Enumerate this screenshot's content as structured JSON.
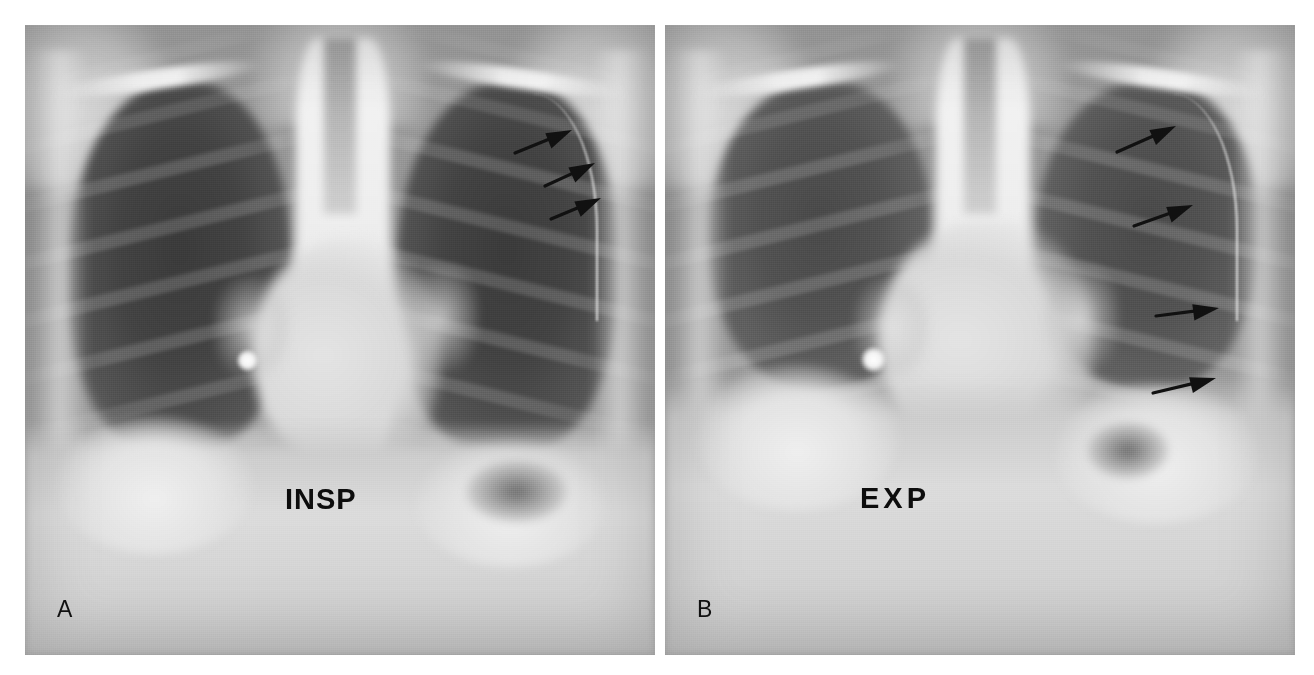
{
  "figure": {
    "kind": "radiograph-pair",
    "modality": "chest-xray",
    "view": "frontal PA",
    "background_color": "#ffffff"
  },
  "panels": [
    {
      "id": "panel-a",
      "letter": "A",
      "phase_label": "INSP",
      "phase_meaning": "inspiration",
      "x": 25,
      "y": 25,
      "width": 630,
      "height": 630,
      "arrow_count": 3,
      "arrows": [
        {
          "tail_x": 515,
          "tail_y": 153,
          "tip_x": 572,
          "tip_y": 130
        },
        {
          "tail_x": 545,
          "tail_y": 186,
          "tip_x": 595,
          "tip_y": 163
        },
        {
          "tail_x": 551,
          "tail_y": 219,
          "tip_x": 601,
          "tip_y": 198
        }
      ]
    },
    {
      "id": "panel-b",
      "letter": "B",
      "phase_label": "EXP",
      "phase_meaning": "expiration",
      "x": 665,
      "y": 25,
      "width": 630,
      "height": 630,
      "arrow_count": 4,
      "arrows": [
        {
          "tail_x": 1117,
          "tail_y": 152,
          "tip_x": 1176,
          "tip_y": 126
        },
        {
          "tail_x": 1134,
          "tail_y": 226,
          "tip_x": 1193,
          "tip_y": 205
        },
        {
          "tail_x": 1156,
          "tail_y": 316,
          "tip_x": 1219,
          "tip_y": 308
        },
        {
          "tail_x": 1153,
          "tail_y": 393,
          "tip_x": 1216,
          "tip_y": 378
        }
      ]
    }
  ],
  "annotation_style": {
    "arrow_color": "#111111",
    "label_color": "#0d0d0d",
    "letter_color": "#111111"
  },
  "tones": {
    "lung_field": "#434343",
    "mediastinum": "#eeeeee",
    "diaphragm": "#d8d8d8",
    "soft_tissue": "#b9b9b9",
    "film_mid": "#9a9a9a"
  }
}
